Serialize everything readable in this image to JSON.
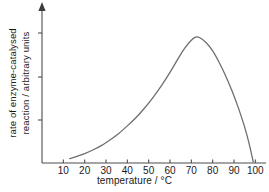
{
  "figure": {
    "background_color": "#ffffff",
    "axis_color": "#4d4d4d",
    "curve_color": "#6e6e6e",
    "text_color": "#1a1a1a"
  },
  "chart_data": {
    "type": "line",
    "title": "",
    "subtitle": "",
    "xlabel": "temperature / °C",
    "ylabel_line1": "rate of enzyme-catalysed",
    "ylabel_line2": "reaction / arbitrary units",
    "xlim": [
      0,
      105
    ],
    "ylim": [
      0,
      1.12
    ],
    "grid": false,
    "legend": false,
    "legend_position": "none",
    "xticks": [
      10,
      20,
      30,
      40,
      50,
      60,
      70,
      80,
      90,
      100
    ],
    "xtick_labels": [
      "10",
      "20",
      "30",
      "40",
      "50",
      "60",
      "70",
      "80",
      "90",
      "100"
    ],
    "yticks": [
      0.33,
      0.66,
      1.0
    ],
    "ytick_labels": [
      "",
      "",
      ""
    ],
    "y_axis_arrow": true,
    "annotations": [],
    "series": [
      {
        "name": "rate of enzyme-catalysed reaction",
        "x": [
          13,
          16,
          20,
          24,
          28,
          32,
          36,
          40,
          44,
          48,
          52,
          56,
          60,
          64,
          67,
          70,
          72,
          74,
          77,
          80,
          83,
          86,
          89,
          92,
          95,
          97,
          99
        ],
        "y": [
          0.035,
          0.05,
          0.075,
          0.105,
          0.14,
          0.185,
          0.235,
          0.295,
          0.36,
          0.435,
          0.52,
          0.615,
          0.72,
          0.835,
          0.915,
          0.975,
          1.0,
          0.995,
          0.955,
          0.89,
          0.8,
          0.695,
          0.575,
          0.44,
          0.285,
          0.16,
          0.01
        ]
      }
    ]
  },
  "axis_titles": {
    "x": "temperature / °C",
    "y_line1": "rate of enzyme-catalysed",
    "y_line2": "reaction / arbitrary units"
  }
}
